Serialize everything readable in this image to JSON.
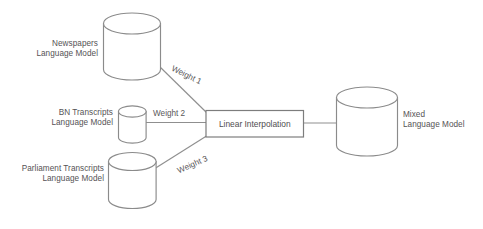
{
  "diagram": {
    "type": "flow-diagram",
    "background_color": "#ffffff",
    "stroke_color": "#8b8b8b",
    "text_color": "#555355",
    "nodes": {
      "newspapers": {
        "label_line1": "Newspapers",
        "label_line2": "Language Model",
        "shape": "cylinder"
      },
      "bn_transcripts": {
        "label_line1": "BN Transcripts",
        "label_line2": "Language Model",
        "shape": "cylinder"
      },
      "parliament": {
        "label_line1": "Parliament Transcripts",
        "label_line2": "Language Model",
        "shape": "cylinder"
      },
      "interpolation": {
        "label": "Linear Interpolation",
        "shape": "rectangle"
      },
      "mixed": {
        "label_line1": "Mixed",
        "label_line2": "Language Model",
        "shape": "cylinder"
      }
    },
    "edges": {
      "weight1": "Weight 1",
      "weight2": "Weight 2",
      "weight3": "Weight 3"
    }
  }
}
